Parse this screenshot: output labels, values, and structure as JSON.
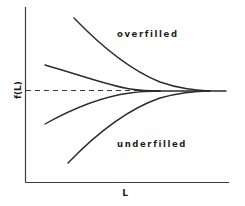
{
  "diagram": {
    "y_axis_label": "f(L)",
    "x_axis_label": "L",
    "regions": {
      "upper": "overfilled",
      "lower": "underfilled"
    },
    "colors": {
      "line": "#2b2b2b",
      "background": "#ffffff"
    },
    "curves": [
      {
        "name": "strongly overfilled",
        "start": [
          74,
          18
        ],
        "converge": [
          205,
          91
        ]
      },
      {
        "name": "slightly overfilled",
        "start": [
          45,
          65
        ],
        "converge": [
          145,
          91
        ]
      },
      {
        "name": "slightly underfilled",
        "start": [
          45,
          124
        ],
        "converge": [
          145,
          91
        ]
      },
      {
        "name": "strongly underfilled",
        "start": [
          68,
          163
        ],
        "converge": [
          205,
          91
        ]
      }
    ],
    "reference_line": {
      "style": "dashed",
      "y": 90
    }
  }
}
